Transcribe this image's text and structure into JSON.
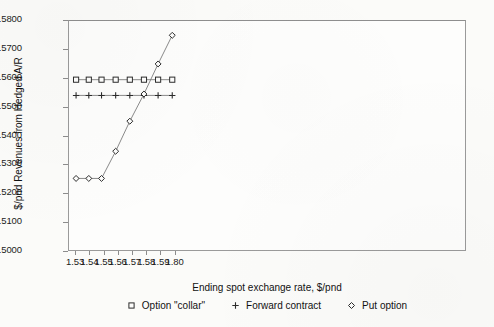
{
  "chart_data": {
    "type": "line",
    "title": "",
    "xlabel": "Ending spot exchange rate, $/pnd",
    "ylabel": "$/pnd Revenues from Hedged A/R",
    "xlim": [
      1.525,
      1.805
    ],
    "ylim": [
      1.5,
      1.58
    ],
    "grid": false,
    "legend_position": "bottom",
    "xticklabels": [
      "1.53",
      "1.54",
      "1.55",
      "1.56",
      "1.57",
      "1.58",
      "1.59",
      "1.80"
    ],
    "xtickvalues": [
      1.53,
      1.54,
      1.55,
      1.56,
      1.57,
      1.58,
      1.59,
      1.6
    ],
    "yticklabels": [
      "1.5000",
      "1.5100",
      "1.5200",
      "1.5300",
      "1.5400",
      "1.5500",
      "1.5600",
      "1.5700",
      "1.5800"
    ],
    "ytickvalues": [
      1.5,
      1.51,
      1.52,
      1.53,
      1.54,
      1.55,
      1.56,
      1.57,
      1.58
    ],
    "x": [
      1.53,
      1.539,
      1.548,
      1.558,
      1.568,
      1.578,
      1.588,
      1.598
    ],
    "series": [
      {
        "name": "Option \"collar\"",
        "marker": "square",
        "values": [
          1.5595,
          1.5595,
          1.5595,
          1.5595,
          1.5595,
          1.5595,
          1.5595,
          1.5595
        ]
      },
      {
        "name": "Forward contract",
        "marker": "plus",
        "values": [
          1.554,
          1.554,
          1.554,
          1.554,
          1.554,
          1.554,
          1.554,
          1.554
        ]
      },
      {
        "name": "Put option",
        "marker": "diamond",
        "values": [
          1.525,
          1.525,
          1.525,
          1.5345,
          1.545,
          1.5545,
          1.565,
          1.575
        ]
      }
    ]
  },
  "colors": {
    "line": "#7c7c7c",
    "marker_stroke": "#2b2b2b",
    "frame": "#9a9a9a",
    "text": "#111111",
    "background": "#fbfbf9"
  }
}
